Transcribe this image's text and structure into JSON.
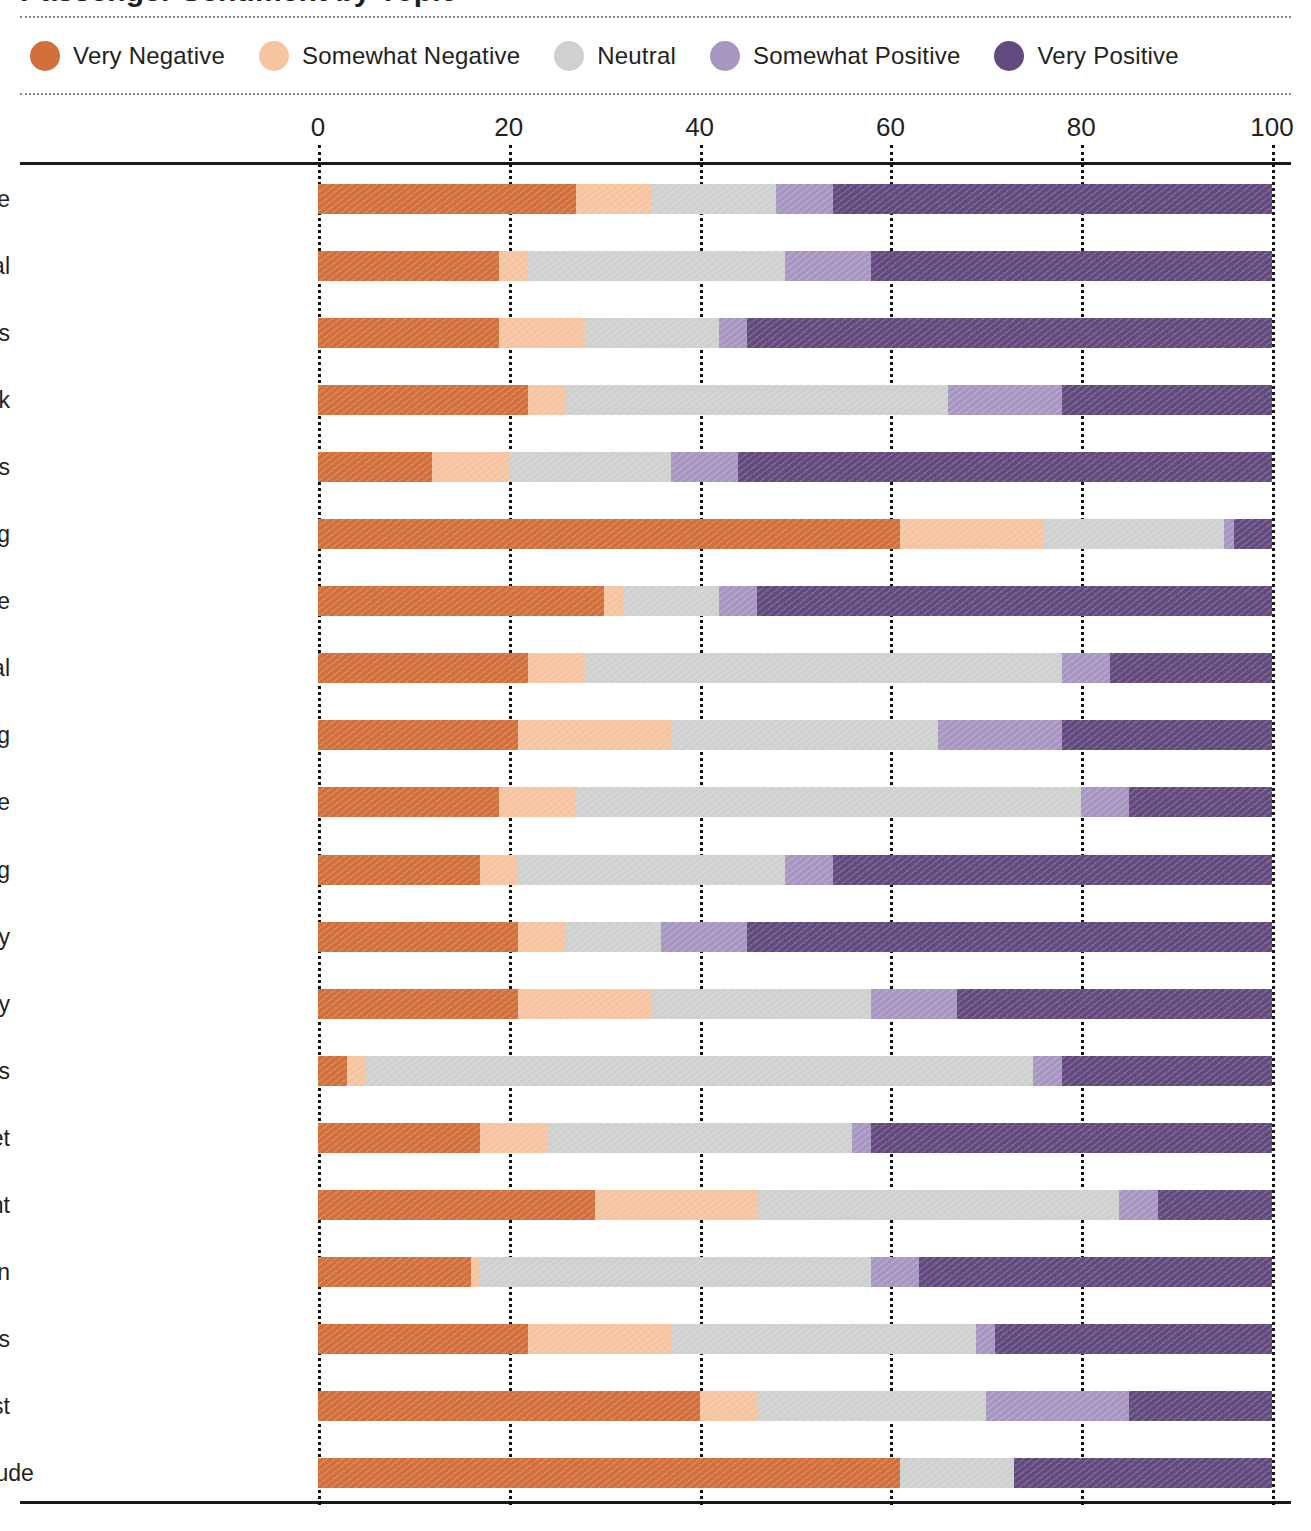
{
  "title": "Passenger Sentiment by Topic",
  "legend": {
    "items": [
      {
        "label": "Very Negative",
        "color": "#d2703c"
      },
      {
        "label": "Somewhat Negative",
        "color": "#f6c4a0"
      },
      {
        "label": "Neutral",
        "color": "#ced1cd"
      },
      {
        "label": "Somewhat Positive",
        "color": "#a896c2"
      },
      {
        "label": "Very Positive",
        "color": "#634a7e"
      }
    ]
  },
  "chart_data": {
    "type": "bar",
    "stacked": true,
    "orientation": "horizontal",
    "normalized_percent": true,
    "title": "Passenger Sentiment by Topic",
    "xlabel": "",
    "ylabel": "",
    "xlim": [
      0,
      100
    ],
    "xticks": [
      0,
      20,
      40,
      60,
      80,
      100
    ],
    "xtick_labels": [
      "0",
      "20",
      "40",
      "60",
      "80",
      "100"
    ],
    "grid": "vertical-dotted",
    "legend_position": "top",
    "series": [
      {
        "name": "Very Negative",
        "color": "#d2703c"
      },
      {
        "name": "Somewhat Negative",
        "color": "#f6c4a0"
      },
      {
        "name": "Neutral",
        "color": "#ced1cd"
      },
      {
        "name": "Somewhat Positive",
        "color": "#a896c2"
      },
      {
        "name": "Very Positive",
        "color": "#634a7e"
      }
    ],
    "categories": [
      "Attitude",
      "Staff | General",
      "Staff | General | Helpfulness",
      "Food & Drink",
      "Cleanliness",
      "Booking | Scheduling",
      "Staff | General | Attitude",
      "Cost | General",
      "Wayfinding",
      "Baggage",
      "Boarding",
      "Food & Drink | Quality",
      "Food & Drink | Variety",
      "Amenities",
      "Internet",
      "Baggage | Management",
      "Check-In",
      "Boarding Process",
      "Food & Drink | Cost",
      "Staff | Customer Service | Attitude"
    ],
    "values": [
      [
        27,
        8,
        13,
        6,
        46
      ],
      [
        19,
        3,
        27,
        9,
        42
      ],
      [
        19,
        9,
        14,
        3,
        55
      ],
      [
        22,
        4,
        40,
        12,
        22
      ],
      [
        12,
        8,
        17,
        7,
        56
      ],
      [
        61,
        15,
        19,
        1,
        4
      ],
      [
        30,
        2,
        10,
        4,
        54
      ],
      [
        22,
        6,
        50,
        5,
        17
      ],
      [
        21,
        16,
        28,
        13,
        22
      ],
      [
        19,
        8,
        53,
        5,
        15
      ],
      [
        17,
        4,
        28,
        5,
        46
      ],
      [
        21,
        5,
        10,
        9,
        55
      ],
      [
        21,
        14,
        23,
        9,
        33
      ],
      [
        3,
        2,
        70,
        3,
        22
      ],
      [
        17,
        7,
        32,
        2,
        42
      ],
      [
        29,
        17,
        38,
        4,
        12
      ],
      [
        16,
        1,
        41,
        5,
        37
      ],
      [
        22,
        15,
        32,
        2,
        29
      ],
      [
        40,
        6,
        24,
        15,
        15
      ],
      [
        61,
        0,
        12,
        0,
        27
      ]
    ]
  }
}
